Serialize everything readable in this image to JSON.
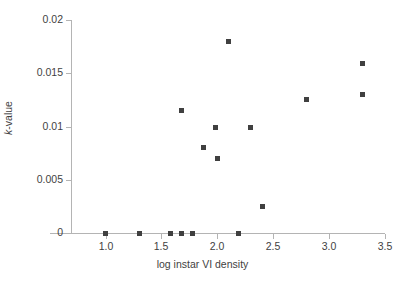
{
  "chart_data": {
    "type": "scatter",
    "title": "",
    "xlabel": "log instar VI density",
    "ylabel": "k-value",
    "ylabel_parts": {
      "italic": "k",
      "rest": "-value"
    },
    "xlim": [
      0.7,
      3.5
    ],
    "ylim": [
      0,
      0.02
    ],
    "xticks": [
      1.0,
      1.5,
      2.0,
      2.5,
      3.0,
      3.5
    ],
    "xticklabels": [
      "1.0",
      "1.5",
      "2.0",
      "2.5",
      "3.0",
      "3.5"
    ],
    "yticks": [
      0,
      0.005,
      0.01,
      0.015,
      0.02
    ],
    "yticklabels": [
      "0",
      "0.005",
      "0.01",
      "0.015",
      "0.02"
    ],
    "grid": false,
    "legend": false,
    "marker": "square",
    "marker_color": "#404040",
    "marker_size_px": 5,
    "axis_color": "#b4b4b4",
    "background": "#ffffff",
    "points": [
      {
        "x": 1.0,
        "y": 0.0
      },
      {
        "x": 1.3,
        "y": 0.0
      },
      {
        "x": 1.58,
        "y": 0.0
      },
      {
        "x": 1.68,
        "y": 0.0
      },
      {
        "x": 1.78,
        "y": 0.0
      },
      {
        "x": 2.19,
        "y": 0.0
      },
      {
        "x": 1.68,
        "y": 0.0115
      },
      {
        "x": 1.88,
        "y": 0.008
      },
      {
        "x": 1.98,
        "y": 0.0099
      },
      {
        "x": 2.0,
        "y": 0.007
      },
      {
        "x": 2.1,
        "y": 0.018
      },
      {
        "x": 2.3,
        "y": 0.0099
      },
      {
        "x": 2.4,
        "y": 0.0025
      },
      {
        "x": 2.8,
        "y": 0.0125
      },
      {
        "x": 3.3,
        "y": 0.0159
      },
      {
        "x": 3.3,
        "y": 0.013
      }
    ]
  }
}
